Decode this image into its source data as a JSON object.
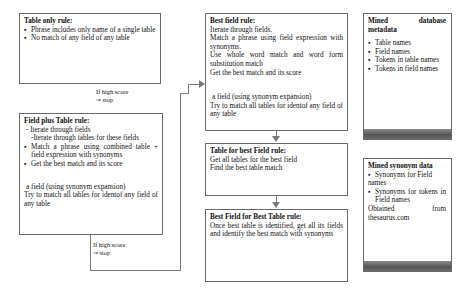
{
  "diagram": {
    "table_only_rule": {
      "title": "Table only rule:",
      "bullets": [
        "Phrase includes only name of a single table",
        "No match of any field of any table"
      ]
    },
    "stop_label_1": {
      "line1": "If high score",
      "line2": "⇒ stop"
    },
    "field_plus_table_rule": {
      "title": "Field plus Table rule:",
      "lines": [
        "- Iterate through fields",
        "-Iterate through tables for these fields"
      ],
      "bullets": [
        "Match a phrase using combined table + field expression with synonyms",
        "Get the best match and its score"
      ],
      "note_line1": "a field (using synonym expansion)",
      "note_line2": "Try to match all tables for identof any field of any table"
    },
    "stop_label_2": {
      "line1": "If high score",
      "line2": "⇒ stop"
    },
    "best_field_rule": {
      "title": "Best field rule:",
      "lines": [
        "Iterate through fields.",
        "Match a phrase using field expression with synonyms.",
        "Use whole word match and word form substitution match",
        "Get the best match and its score"
      ],
      "note_line1": "a field (using synonym expansion)",
      "note_line2": "Try to match all tables for identof any field of any table"
    },
    "table_for_best_field_rule": {
      "title": "Table for best Field rule:",
      "lines": [
        "Get all tables for the best field",
        "Find the best table match"
      ]
    },
    "best_field_for_best_table_rule": {
      "title": "Best Field for Best Table rule:",
      "text": "Once best table is identified, get all its fields and identify the best match with synonyms"
    },
    "mined_database_metadata": {
      "title": "Mined database metadata",
      "bullets": [
        "Table names",
        "Field names",
        "Tokens in table names",
        "Tokens in field names"
      ]
    },
    "mined_synonym_data": {
      "title": "Mined synonym data",
      "bullets": [
        "Synonyms for Field names",
        "Synonyms for tokens in Field names"
      ],
      "footer": "Obtained from thesaurus.com"
    }
  },
  "colors": {
    "border": "#6a6a6a",
    "connector": "#7a7a7a",
    "dark_band": "#555555"
  }
}
